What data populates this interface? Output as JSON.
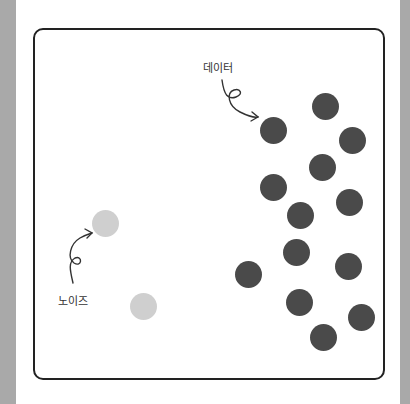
{
  "diagram": {
    "labels": {
      "data": "데이터",
      "noise": "노이즈"
    },
    "colors": {
      "data_point": "#4a4a4a",
      "noise_point": "#cfcfcf",
      "frame": "#222222",
      "side_band": "#a9a9a9"
    },
    "data_points": [
      {
        "x": 273,
        "y": 130
      },
      {
        "x": 325,
        "y": 106
      },
      {
        "x": 352,
        "y": 140
      },
      {
        "x": 322,
        "y": 167
      },
      {
        "x": 273,
        "y": 187
      },
      {
        "x": 300,
        "y": 215
      },
      {
        "x": 349,
        "y": 202
      },
      {
        "x": 296,
        "y": 252
      },
      {
        "x": 248,
        "y": 274
      },
      {
        "x": 348,
        "y": 266
      },
      {
        "x": 299,
        "y": 302
      },
      {
        "x": 361,
        "y": 317
      },
      {
        "x": 323,
        "y": 337
      }
    ],
    "noise_points": [
      {
        "x": 105,
        "y": 223
      },
      {
        "x": 143,
        "y": 306
      }
    ]
  }
}
